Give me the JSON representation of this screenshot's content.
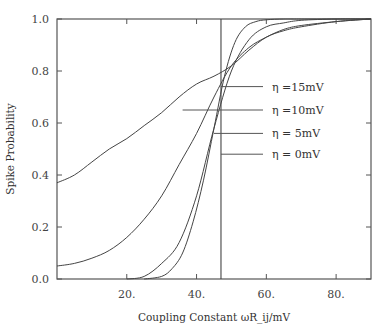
{
  "chart_data": {
    "type": "line",
    "title": "",
    "xlabel": "Coupling Constant ωR_ij/mV",
    "ylabel": "Spike Probability",
    "xlim": [
      0,
      90
    ],
    "ylim": [
      0,
      1.0
    ],
    "xticks": [
      20,
      40,
      60,
      80
    ],
    "xtick_labels": [
      "20.",
      "40.",
      "60.",
      "80."
    ],
    "yticks": [
      0.0,
      0.2,
      0.4,
      0.6,
      0.8,
      1.0
    ],
    "ytick_labels": [
      "0.0",
      "0.2",
      "0.4",
      "0.6",
      "0.8",
      "1.0"
    ],
    "grid": false,
    "vertical_line_x": 47,
    "series": [
      {
        "name": "η =15mV",
        "x": [
          0,
          5,
          10,
          15,
          20,
          25,
          30,
          35,
          40,
          45,
          50,
          55,
          60,
          65,
          70,
          80,
          90
        ],
        "values": [
          0.37,
          0.4,
          0.45,
          0.5,
          0.54,
          0.59,
          0.64,
          0.7,
          0.75,
          0.78,
          0.82,
          0.88,
          0.93,
          0.955,
          0.97,
          0.99,
          1.0
        ]
      },
      {
        "name": "η =10mV",
        "x": [
          0,
          5,
          10,
          15,
          20,
          25,
          30,
          35,
          40,
          45,
          50,
          55,
          60,
          65,
          70,
          80,
          90
        ],
        "values": [
          0.05,
          0.06,
          0.08,
          0.11,
          0.16,
          0.23,
          0.32,
          0.44,
          0.56,
          0.7,
          0.82,
          0.89,
          0.93,
          0.96,
          0.975,
          0.99,
          1.0
        ]
      },
      {
        "name": "η = 5mV",
        "x": [
          20,
          25,
          30,
          35,
          40,
          45,
          50,
          55,
          60,
          65,
          70,
          80,
          90
        ],
        "values": [
          0.0,
          0.01,
          0.06,
          0.14,
          0.32,
          0.58,
          0.8,
          0.92,
          0.97,
          0.985,
          0.995,
          1.0,
          1.0
        ]
      },
      {
        "name": "η = 0mV",
        "x": [
          25,
          30,
          33,
          36,
          39,
          42,
          45,
          48,
          51,
          54,
          57,
          60,
          65,
          70,
          90
        ],
        "values": [
          0.0,
          0.01,
          0.04,
          0.1,
          0.22,
          0.38,
          0.58,
          0.78,
          0.91,
          0.97,
          0.99,
          0.997,
          1.0,
          1.0,
          1.0
        ]
      }
    ],
    "legend": {
      "position": "inside-right",
      "entries": [
        {
          "label": "η =15mV",
          "leader_from_x": 47,
          "y": 0.74
        },
        {
          "label": "η =10mV",
          "leader_from_x": 36,
          "y": 0.65
        },
        {
          "label": "η = 5mV",
          "leader_from_x": 45,
          "y": 0.56
        },
        {
          "label": "η = 0mV",
          "leader_from_x": 47,
          "y": 0.48
        }
      ]
    }
  }
}
